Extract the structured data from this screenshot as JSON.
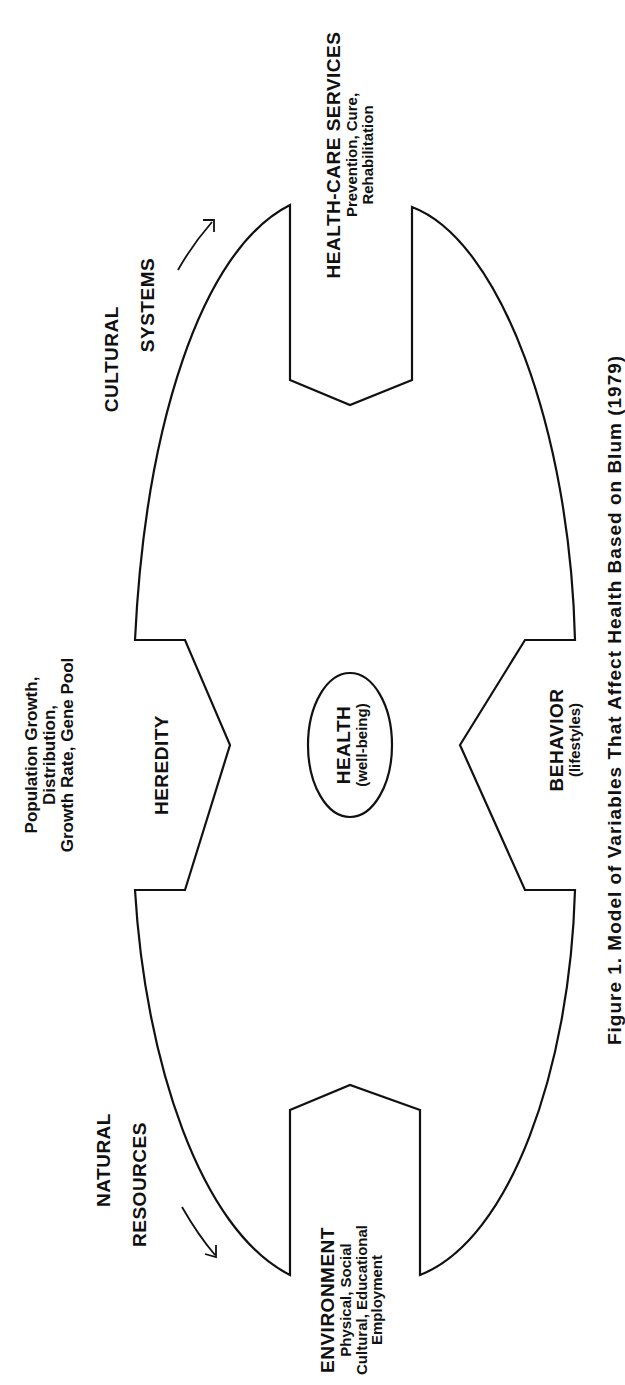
{
  "diagram": {
    "title": "Model of Variables That Affect Health",
    "center": {
      "label": "HEALTH",
      "sublabel": "(well-being)"
    },
    "factors": [
      {
        "id": "environment",
        "label": "ENVIRONMENT",
        "lines": [
          "Physical, Social",
          "Cultural, Educational",
          "Employment"
        ]
      },
      {
        "id": "heredity",
        "label": "HEREDITY"
      },
      {
        "id": "health_care_services",
        "label": "HEALTH-CARE SERVICES",
        "lines": [
          "Prevention, Cure,",
          "Rehabilitation"
        ]
      },
      {
        "id": "behavior",
        "label": "BEHAVIOR",
        "lines": [
          "(lifestyles)"
        ]
      }
    ],
    "outer": {
      "natural_resources": [
        "NATURAL",
        "RESOURCES"
      ],
      "cultural_systems": [
        "CULTURAL",
        "SYSTEMS"
      ],
      "population": [
        "Population Growth,",
        "Distribution,",
        "Growth Rate, Gene Pool"
      ]
    },
    "caption": "Figure 1. Model of Variables That Affect Health Based on Blum (1979)"
  },
  "colors": {
    "line": "#111111",
    "background": "#ffffff"
  }
}
